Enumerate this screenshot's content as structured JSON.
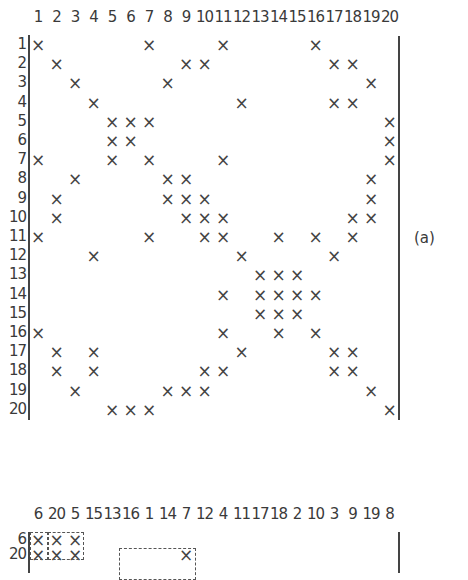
{
  "figure_label": "(a)",
  "top_matrix": {
    "columns": [
      "1",
      "2",
      "3",
      "4",
      "5",
      "6",
      "7",
      "8",
      "9",
      "10",
      "11",
      "12",
      "13",
      "14",
      "15",
      "16",
      "17",
      "18",
      "19",
      "20"
    ],
    "rows": [
      "1",
      "2",
      "3",
      "4",
      "5",
      "6",
      "7",
      "8",
      "9",
      "10",
      "11",
      "12",
      "13",
      "14",
      "15",
      "16",
      "17",
      "18",
      "19",
      "20"
    ],
    "marker": "×",
    "entries": {
      "1": [
        1,
        7,
        11,
        16
      ],
      "2": [
        2,
        9,
        10,
        17,
        18
      ],
      "3": [
        3,
        8,
        19
      ],
      "4": [
        4,
        12,
        17,
        18
      ],
      "5": [
        5,
        6,
        7,
        20
      ],
      "6": [
        5,
        6,
        20
      ],
      "7": [
        1,
        5,
        7,
        11,
        20
      ],
      "8": [
        3,
        8,
        9,
        19
      ],
      "9": [
        2,
        8,
        9,
        10,
        19
      ],
      "10": [
        2,
        9,
        10,
        11,
        18,
        19
      ],
      "11": [
        1,
        7,
        10,
        11,
        14,
        16,
        18
      ],
      "12": [
        4,
        12,
        17
      ],
      "13": [
        13,
        14,
        15
      ],
      "14": [
        11,
        13,
        14,
        15,
        16
      ],
      "15": [
        13,
        14,
        15
      ],
      "16": [
        1,
        11,
        14,
        16
      ],
      "17": [
        2,
        4,
        12,
        17,
        18
      ],
      "18": [
        2,
        4,
        10,
        11,
        17,
        18
      ],
      "19": [
        3,
        8,
        9,
        10,
        19
      ],
      "20": [
        5,
        6,
        7,
        20
      ]
    }
  },
  "bottom_matrix": {
    "columns": [
      "6",
      "20",
      "5",
      "15",
      "13",
      "16",
      "1",
      "14",
      "7",
      "12",
      "4",
      "11",
      "17",
      "18",
      "2",
      "10",
      "3",
      "9",
      "19",
      "8"
    ],
    "rows_visible": [
      "6",
      "20"
    ],
    "marker": "×",
    "entries_by_position": {
      "6": [
        1,
        2,
        3
      ],
      "20": [
        1,
        2,
        3,
        9
      ]
    }
  }
}
